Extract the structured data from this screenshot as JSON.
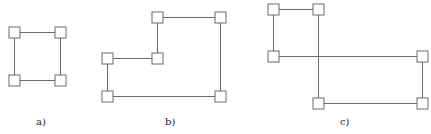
{
  "figures": [
    {
      "id": "a",
      "label": "a)",
      "label_pos": [
        36,
        125
      ],
      "nodes": [
        [
          14,
          32
        ],
        [
          60,
          32
        ],
        [
          14,
          80
        ],
        [
          60,
          80
        ]
      ],
      "edges": [
        [
          0,
          1
        ],
        [
          1,
          3
        ],
        [
          3,
          2
        ],
        [
          2,
          0
        ]
      ]
    },
    {
      "id": "b",
      "label": "b)",
      "label_pos": [
        165,
        125
      ],
      "nodes": [
        [
          157,
          17
        ],
        [
          220,
          17
        ],
        [
          107,
          58
        ],
        [
          157,
          58
        ],
        [
          107,
          96
        ],
        [
          220,
          96
        ]
      ],
      "edges": [
        [
          0,
          1
        ],
        [
          1,
          5
        ],
        [
          5,
          4
        ],
        [
          4,
          2
        ],
        [
          2,
          3
        ],
        [
          3,
          0
        ]
      ]
    },
    {
      "id": "c",
      "label": "c)",
      "label_pos": [
        340,
        125
      ],
      "nodes": [
        [
          273,
          9
        ],
        [
          318,
          9
        ],
        [
          273,
          56
        ],
        [
          422,
          56
        ],
        [
          318,
          103
        ],
        [
          422,
          103
        ]
      ],
      "edges": [
        [
          0,
          1
        ],
        [
          1,
          4
        ],
        [
          4,
          5
        ],
        [
          5,
          3
        ],
        [
          3,
          2
        ],
        [
          2,
          0
        ]
      ]
    }
  ],
  "style": {
    "node_size": 11,
    "stroke_color": "#6a6a6a"
  }
}
